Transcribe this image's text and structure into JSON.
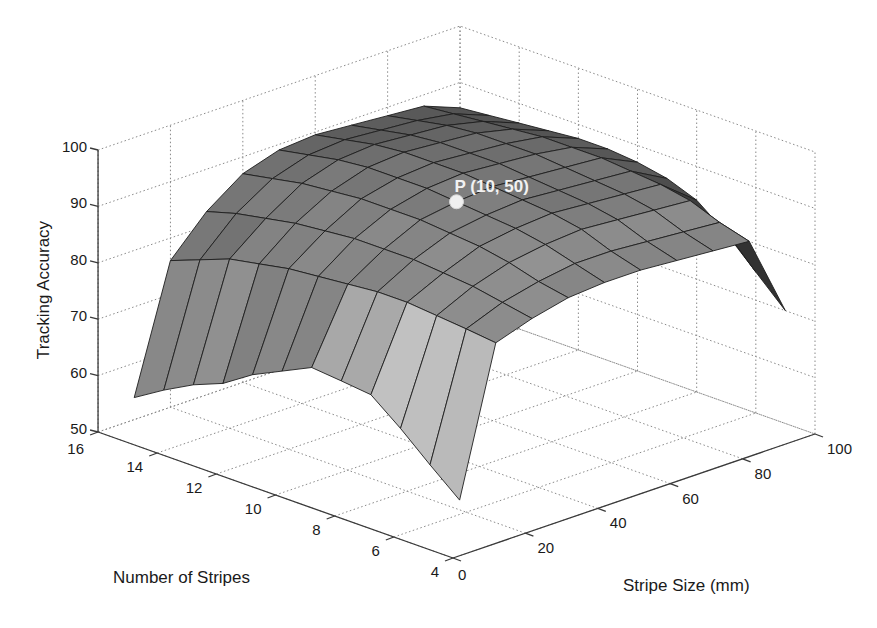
{
  "chart_data": {
    "type": "surface3d",
    "title": "",
    "xlabel": "Stripe Size (mm)",
    "ylabel": "Number of Stripes",
    "zlabel": "Tracking Accuracy",
    "x_ticks": [
      0,
      20,
      40,
      60,
      80,
      100
    ],
    "y_ticks": [
      4,
      6,
      8,
      10,
      12,
      14,
      16
    ],
    "z_ticks": [
      50,
      60,
      70,
      80,
      90,
      100
    ],
    "xlim": [
      0,
      100
    ],
    "ylim": [
      4,
      16
    ],
    "zlim": [
      50,
      100
    ],
    "grid": true,
    "colormap": "gray",
    "annotation": {
      "label": "P (10, 50)",
      "stripes": 10,
      "size": 50,
      "value": 91
    },
    "stripe_sizes": [
      10,
      20,
      30,
      40,
      50,
      60,
      70,
      80,
      90,
      100
    ],
    "number_of_stripes": [
      5,
      6,
      7,
      8,
      9,
      10,
      11,
      12,
      13,
      14,
      15,
      16
    ],
    "z": [
      [
        56.2,
        81.9,
        84.0,
        85.5,
        86.0,
        86.0,
        85.5,
        85.0,
        84.5,
        70.0
      ],
      [
        60.6,
        82.5,
        85.0,
        86.5,
        87.5,
        87.5,
        87.0,
        86.5,
        86.0,
        75.0
      ],
      [
        65.2,
        83.0,
        86.0,
        88.0,
        89.0,
        89.5,
        89.0,
        88.5,
        88.0,
        80.0
      ],
      [
        69.3,
        83.5,
        86.5,
        89.0,
        90.0,
        90.5,
        90.0,
        89.5,
        89.0,
        84.0
      ],
      [
        69.9,
        83.5,
        87.0,
        89.5,
        90.5,
        91.0,
        90.5,
        90.0,
        89.5,
        86.0
      ],
      [
        70.4,
        83.0,
        87.0,
        90.0,
        91.0,
        91.5,
        91.0,
        90.5,
        90.0,
        87.0
      ],
      [
        67.9,
        82.5,
        87.0,
        90.0,
        91.5,
        92.0,
        91.5,
        91.0,
        90.0,
        87.5
      ],
      [
        65.4,
        82.0,
        86.5,
        90.0,
        91.5,
        92.0,
        91.5,
        91.0,
        90.0,
        87.5
      ],
      [
        62.0,
        81.0,
        86.0,
        89.5,
        91.5,
        92.0,
        91.5,
        91.0,
        89.5,
        87.0
      ],
      [
        59.9,
        80.0,
        85.0,
        89.0,
        91.0,
        91.5,
        91.0,
        90.5,
        89.0,
        86.5
      ],
      [
        57.1,
        78.0,
        84.0,
        88.0,
        90.0,
        90.5,
        90.0,
        89.5,
        88.5,
        86.0
      ],
      [
        53.9,
        76.0,
        82.5,
        87.0,
        89.0,
        89.5,
        89.0,
        88.5,
        88.0,
        85.5
      ]
    ]
  }
}
